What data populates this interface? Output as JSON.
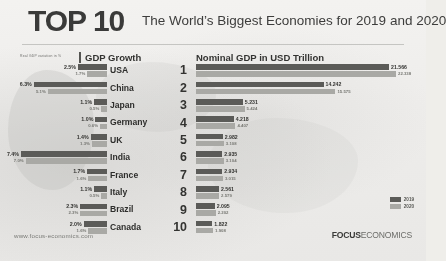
{
  "header": {
    "top_label": "TOP 10",
    "subtitle": "The World’s Biggest Economies for 2019 and 2020"
  },
  "columns": {
    "growth_header": "GDP Growth",
    "growth_axis_note": "Real GDP variation in %",
    "nominal_header": "Nominal GDP in USD Trillion"
  },
  "legend": {
    "items": [
      {
        "label": "2019",
        "color": "#5b5b56"
      },
      {
        "label": "2020",
        "color": "#a9a9a2"
      }
    ]
  },
  "footer": {
    "website": "www.focus-economics.com",
    "brand_bold": "FOCUS",
    "brand_light": "ECONOMICS"
  },
  "chart_data": {
    "type": "bar",
    "title": "The World’s Biggest Economies for 2019 and 2020",
    "orientation": "horizontal",
    "categories": [
      "USA",
      "China",
      "Japan",
      "Germany",
      "UK",
      "India",
      "France",
      "Italy",
      "Brazil",
      "Canada"
    ],
    "ranks": [
      1,
      2,
      3,
      4,
      5,
      6,
      7,
      8,
      9,
      10
    ],
    "panels": [
      {
        "name": "GDP Growth",
        "xlabel": "Real GDP variation in %",
        "unit": "%",
        "direction": "right-to-left",
        "series": [
          {
            "name": "2019",
            "values": [
              2.5,
              6.3,
              1.1,
              1.0,
              1.4,
              7.4,
              1.7,
              1.1,
              2.3,
              2.0
            ]
          },
          {
            "name": "2020",
            "values": [
              1.7,
              5.1,
              0.5,
              0.6,
              1.3,
              7.0,
              1.6,
              0.5,
              2.3,
              1.6
            ]
          }
        ]
      },
      {
        "name": "Nominal GDP in USD Trillion",
        "xlabel": "USD Trillion",
        "unit": "USD Trillion",
        "direction": "left-to-right",
        "series": [
          {
            "name": "2019",
            "values": [
              21.566,
              14.242,
              5.231,
              4.218,
              2.982,
              2.935,
              2.934,
              2.561,
              2.095,
              1.822
            ]
          },
          {
            "name": "2020",
            "values": [
              22.338,
              15.575,
              5.424,
              4.407,
              3.108,
              3.104,
              3.015,
              2.579,
              2.202,
              1.908
            ]
          }
        ]
      }
    ],
    "legend": [
      "2019",
      "2020"
    ],
    "legend_position": "bottom-right",
    "grid": false
  },
  "rows": [
    {
      "country": "USA",
      "rank": "1",
      "g19": "2.5%",
      "g20": "1.7%",
      "n19": "21.566",
      "n20": "22.338"
    },
    {
      "country": "China",
      "rank": "2",
      "g19": "6.3%",
      "g20": "5.1%",
      "n19": "14.242",
      "n20": "15.575"
    },
    {
      "country": "Japan",
      "rank": "3",
      "g19": "1.1%",
      "g20": "0.5%",
      "n19": "5.231",
      "n20": "5.424"
    },
    {
      "country": "Germany",
      "rank": "4",
      "g19": "1.0%",
      "g20": "0.6%",
      "n19": "4.218",
      "n20": "4.407"
    },
    {
      "country": "UK",
      "rank": "5",
      "g19": "1.4%",
      "g20": "1.3%",
      "n19": "2.982",
      "n20": "3.108"
    },
    {
      "country": "India",
      "rank": "6",
      "g19": "7.4%",
      "g20": "7.0%",
      "n19": "2.935",
      "n20": "3.104"
    },
    {
      "country": "France",
      "rank": "7",
      "g19": "1.7%",
      "g20": "1.6%",
      "n19": "2.934",
      "n20": "3.015"
    },
    {
      "country": "Italy",
      "rank": "8",
      "g19": "1.1%",
      "g20": "0.5%",
      "n19": "2.561",
      "n20": "2.579"
    },
    {
      "country": "Brazil",
      "rank": "9",
      "g19": "2.3%",
      "g20": "2.3%",
      "n19": "2.095",
      "n20": "2.202"
    },
    {
      "country": "Canada",
      "rank": "10",
      "g19": "2.0%",
      "g20": "1.6%",
      "n19": "1.822",
      "n20": "1.908"
    }
  ]
}
